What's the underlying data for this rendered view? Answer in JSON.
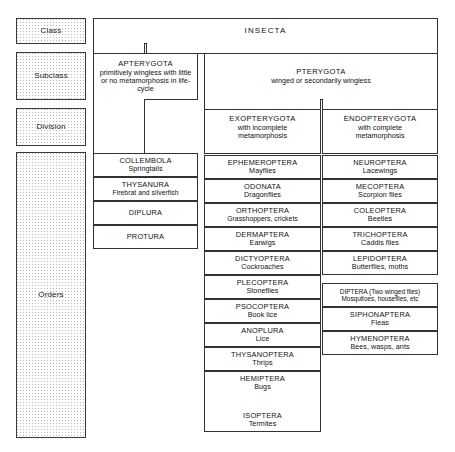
{
  "diagram": {
    "ranks": [
      {
        "id": "class",
        "label": "Class"
      },
      {
        "id": "subclass",
        "label": "Subclass"
      },
      {
        "id": "division",
        "label": "Division"
      },
      {
        "id": "orders",
        "label": "Orders"
      }
    ],
    "class_box": {
      "name": "INSECTA"
    },
    "subclasses": [
      {
        "name": "APTERYGOTA",
        "description": "primitively wingless with little or no metamorphosis in life-cycle"
      },
      {
        "name": "PTERYGOTA",
        "description": "winged or secondarily wingless"
      }
    ],
    "divisions": [
      {
        "name": "EXOPTERYGOTA",
        "description_line1": "with incomplete",
        "description_line2": "metamorphosis"
      },
      {
        "name": "ENDOPTERYGOTA",
        "description_line1": "with complete",
        "description_line2": "metamorphosis"
      }
    ],
    "orders_apterygota": [
      {
        "name": "COLLEMBOLA",
        "common": "Springtails"
      },
      {
        "name": "THYSANURA",
        "common": "Firebrat and silverfish"
      },
      {
        "name": "DIPLURA",
        "common": ""
      },
      {
        "name": "PROTURA",
        "common": ""
      }
    ],
    "orders_exopterygota": [
      {
        "name": "EPHEMEROPTERA",
        "common": "Mayflies"
      },
      {
        "name": "ODONATA",
        "common": "Dragonflies"
      },
      {
        "name": "ORTHOPTERA",
        "common": "Grasshoppers, crickets"
      },
      {
        "name": "DERMAPTERA",
        "common": "Earwigs"
      },
      {
        "name": "DICTYOPTERA",
        "common": "Cockroaches"
      },
      {
        "name": "PLECOPTERA",
        "common": "Stoneflies"
      },
      {
        "name": "PSOCOPTERA",
        "common": "Book lice"
      },
      {
        "name": "ANOPLURA",
        "common": "Lice"
      },
      {
        "name": "THYSANOPTERA",
        "common": "Thrips"
      },
      {
        "name": "HEMIPTERA",
        "common": "Bugs"
      },
      {
        "name": "ISOPTERA",
        "common": "Termites"
      }
    ],
    "orders_endopterygota": [
      {
        "name": "NEUROPTERA",
        "common": "Lacewings"
      },
      {
        "name": "MECOPTERA",
        "common": "Scorpion flies"
      },
      {
        "name": "COLEOPTERA",
        "common": "Beetles"
      },
      {
        "name": "TRICHOPTERA",
        "common": "Caddis flies"
      },
      {
        "name": "LEPIDOPTERA",
        "common": "Butterflies, moths"
      },
      {
        "name": "DIPTERA (Two winged flies)",
        "common": "Mosquitoes, houseflies, etc"
      },
      {
        "name": "SIPHONAPTERA",
        "common": "Fleas"
      },
      {
        "name": "HYMENOPTERA",
        "common": "Bees, wasps, ants"
      }
    ],
    "colors": {
      "border": "#333333",
      "background": "#ffffff",
      "stipple": "#b9b9b9",
      "text": "#111111"
    }
  }
}
